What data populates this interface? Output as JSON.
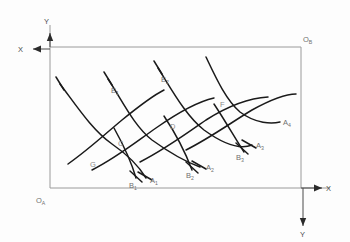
{
  "diagram": {
    "background_color": "#fdfdfd",
    "curve_color": "#1a1a1a",
    "frame_color": "#9a9a9a",
    "label_color": "#6f6f6f",
    "axis_label_color": "#4a4a4a"
  },
  "origins": {
    "lower_left": {
      "label": "O",
      "sub": "A"
    },
    "upper_right": {
      "label": "O",
      "sub": "B"
    }
  },
  "axes": [
    {
      "name": "axis-x-upper",
      "label": "X",
      "direction": "left",
      "x": 23,
      "y": 49
    },
    {
      "name": "axis-y-upper",
      "label": "Y",
      "direction": "up",
      "x": 47,
      "y": 25
    },
    {
      "name": "axis-x-lower",
      "label": "X",
      "direction": "right",
      "x": 330,
      "y": 188
    },
    {
      "name": "axis-y-lower",
      "label": "Y",
      "direction": "down",
      "x": 303,
      "y": 236
    }
  ],
  "endpoint_labels": [
    {
      "name": "label-a1",
      "base": "A",
      "sub": "1",
      "x": 150,
      "y": 183
    },
    {
      "name": "label-a2",
      "base": "A",
      "sub": "2",
      "x": 206,
      "y": 170
    },
    {
      "name": "label-a3",
      "base": "A",
      "sub": "3",
      "x": 256,
      "y": 148
    },
    {
      "name": "label-a4",
      "base": "A",
      "sub": "4",
      "x": 283,
      "y": 125
    },
    {
      "name": "label-b1",
      "base": "B",
      "sub": "1",
      "x": 131,
      "y": 186
    },
    {
      "name": "label-b2",
      "base": "B",
      "sub": "2",
      "x": 188,
      "y": 176
    },
    {
      "name": "label-b3",
      "base": "B",
      "sub": "3",
      "x": 238,
      "y": 156
    },
    {
      "name": "label-e1",
      "base": "E",
      "sub": "1",
      "x": 111,
      "y": 92
    },
    {
      "name": "label-e2",
      "base": "E",
      "sub": "2",
      "x": 160,
      "y": 80
    }
  ],
  "point_labels": [
    {
      "name": "label-c",
      "text": "C",
      "x": 121,
      "y": 144
    },
    {
      "name": "label-d",
      "text": "D",
      "x": 172,
      "y": 127
    },
    {
      "name": "label-f",
      "text": "F",
      "x": 221,
      "y": 105
    },
    {
      "name": "label-g",
      "text": "G",
      "x": 93,
      "y": 164
    }
  ],
  "frame": {
    "left": 50,
    "top": 47,
    "right": 301,
    "bottom": 188
  },
  "curves": {
    "family_a": [
      "M 60,84 C 76,105 92,130 112,144 C 128,155 140,168 146,178",
      "M 108,79 C 122,100 134,126 152,140 C 170,153 186,162 200,167",
      "M 158,68 C 172,90 186,116 204,130 C 222,143 240,150 252,145",
      "M 206,57 C 216,78 226,100 240,112 C 256,124 272,124 280,122"
    ],
    "family_b": [
      "M 68,164 C 88,150 104,135 122,120 C 138,107 152,96 164,90",
      "M 92,170 C 116,158 136,142 156,128 C 176,114 196,102 214,98",
      "M 140,162 C 164,150 186,134 206,120 C 228,106 250,98 268,97",
      "M 186,150 C 210,138 232,122 252,110 C 272,99 288,94 296,94"
    ],
    "family_e": [
      "M 114,128 C 124,146 132,164 136,178",
      "M 164,116 C 176,134 186,154 192,170",
      "M 214,104 C 226,122 236,140 244,152"
    ],
    "ticks": [
      {
        "x1": 58,
        "y1": 78,
        "x2": 62,
        "y2": 90
      },
      {
        "x1": 106,
        "y1": 73,
        "x2": 110,
        "y2": 85
      },
      {
        "x1": 156,
        "y1": 62,
        "x2": 160,
        "y2": 74
      },
      {
        "x1": 140,
        "y1": 174,
        "x2": 152,
        "y2": 179
      },
      {
        "x1": 194,
        "y1": 163,
        "x2": 206,
        "y2": 167
      },
      {
        "x1": 240,
        "y1": 142,
        "x2": 252,
        "y2": 146
      },
      {
        "x1": 130,
        "y1": 173,
        "x2": 142,
        "y2": 181
      },
      {
        "x1": 186,
        "y1": 164,
        "x2": 198,
        "y2": 172
      },
      {
        "x1": 236,
        "y1": 146,
        "x2": 248,
        "y2": 152
      }
    ]
  }
}
